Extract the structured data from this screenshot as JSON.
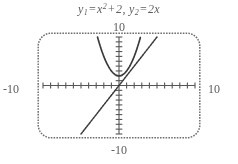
{
  "figure": {
    "kind": "graphing-calculator-screen",
    "title": {
      "full_text": "y1 = x^2 + 2, y2 = 2x",
      "func1": {
        "name": "y",
        "subscript": "1",
        "equals": "=",
        "expression_base": "x",
        "exponent": "2",
        "plus": "+",
        "constant": "2"
      },
      "func2": {
        "name": "y",
        "subscript": "2",
        "equals": "=",
        "expression": "2x"
      },
      "comma": ","
    },
    "axis_labels": {
      "top": "10",
      "bottom": "-10",
      "left": "-10",
      "right": "10"
    },
    "window": {
      "xmin": -10,
      "xmax": 10,
      "xscl": 1,
      "ymin": -10,
      "ymax": 10,
      "yscl": 1
    },
    "colors": {
      "ink": "#2b2b2b",
      "frame": "#5a5a5a",
      "axis": "#4a4a4a",
      "curve": "#1f1f1f",
      "background": "#ffffff"
    }
  },
  "chart_data": {
    "type": "line",
    "xlabel": "",
    "ylabel": "",
    "xlim": [
      -10,
      10
    ],
    "ylim": [
      -10,
      10
    ],
    "grid": false,
    "legend": "none",
    "xticks": [
      -10,
      -9,
      -8,
      -7,
      -6,
      -5,
      -4,
      -3,
      -2,
      -1,
      0,
      1,
      2,
      3,
      4,
      5,
      6,
      7,
      8,
      9,
      10
    ],
    "yticks": [
      -10,
      -9,
      -8,
      -7,
      -6,
      -5,
      -4,
      -3,
      -2,
      -1,
      0,
      1,
      2,
      3,
      4,
      5,
      6,
      7,
      8,
      9,
      10
    ],
    "tick_labels_shown": [
      "-10",
      "10",
      "-10",
      "10"
    ],
    "series": [
      {
        "name": "y1 = x^2 + 2",
        "formula": "y = x*x + 2",
        "x": [
          -2.9,
          -2.7,
          -2.5,
          -2.3,
          -2.1,
          -1.9,
          -1.7,
          -1.5,
          -1.3,
          -1.1,
          -0.9,
          -0.7,
          -0.5,
          -0.3,
          -0.1,
          0.1,
          0.3,
          0.5,
          0.7,
          0.9,
          1.1,
          1.3,
          1.5,
          1.7,
          1.9,
          2.1,
          2.3,
          2.5,
          2.7,
          2.9
        ],
        "values": [
          10.41,
          9.29,
          8.25,
          7.29,
          6.41,
          5.61,
          4.89,
          4.25,
          3.69,
          3.21,
          2.81,
          2.49,
          2.25,
          2.09,
          2.01,
          2.01,
          2.09,
          2.25,
          2.49,
          2.81,
          3.21,
          3.69,
          4.25,
          4.89,
          5.61,
          6.41,
          7.29,
          8.25,
          9.29,
          10.41
        ]
      },
      {
        "name": "y2 = 2x",
        "formula": "y = 2*x",
        "x": [
          -5,
          -4,
          -3,
          -2,
          -1,
          0,
          1,
          2,
          3,
          4,
          5
        ],
        "values": [
          -10,
          -8,
          -6,
          -4,
          -2,
          0,
          2,
          4,
          6,
          8,
          10
        ]
      }
    ],
    "annotations": []
  }
}
